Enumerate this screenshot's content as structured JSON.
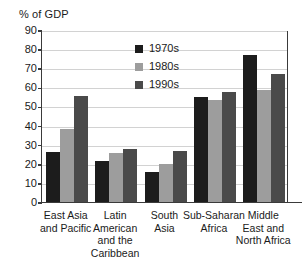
{
  "chart_data": {
    "type": "bar",
    "title": "% of GDP",
    "xlabel": "",
    "ylabel": "",
    "ylim": [
      0,
      90
    ],
    "ytick_step": 10,
    "yticks": [
      "90",
      "80",
      "70",
      "60",
      "50",
      "40",
      "30",
      "20",
      "10",
      "0"
    ],
    "grid": true,
    "legend_position": "inside upper center-right",
    "categories": [
      "East Asia and Pacific",
      "Latin American and the Caribbean",
      "South Asia",
      "Sub-Saharan Africa",
      "Middle East and North Africa"
    ],
    "category_lines": [
      [
        "East Asia",
        "and Pacific"
      ],
      [
        "Latin",
        "American",
        "and the",
        "Caribbean"
      ],
      [
        "South",
        "Asia"
      ],
      [
        "Sub-Saharan",
        "Africa"
      ],
      [
        "Middle",
        "East and",
        "North Africa"
      ]
    ],
    "series": [
      {
        "name": "1970s",
        "color": "#1c1c1c",
        "values": [
          26,
          21.5,
          15.5,
          55,
          77
        ]
      },
      {
        "name": "1980s",
        "color": "#9d9d9d",
        "values": [
          38,
          25.5,
          20,
          53.5,
          58.5
        ]
      },
      {
        "name": "1990s",
        "color": "#4a4a4a",
        "values": [
          55.5,
          28,
          26.5,
          57.5,
          67
        ]
      }
    ]
  },
  "legend": {
    "items": [
      {
        "label": "1970s"
      },
      {
        "label": "1980s"
      },
      {
        "label": "1990s"
      }
    ]
  }
}
